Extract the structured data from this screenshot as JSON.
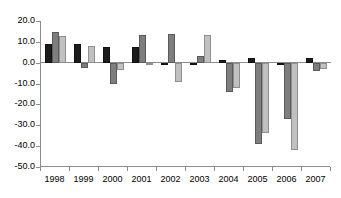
{
  "chart_data": {
    "type": "bar",
    "title": "",
    "subtitle": "",
    "xlabel": "",
    "ylabel": "",
    "categories": [
      "1998",
      "1999",
      "2000",
      "2001",
      "2002",
      "2003",
      "2004",
      "2005",
      "2006",
      "2007"
    ],
    "ylim": [
      -50.0,
      20.0
    ],
    "ytick_labels": [
      "20.0",
      "10.0",
      "0.0",
      "-10.0",
      "-20.0",
      "-30.0",
      "-40.0",
      "-50.0"
    ],
    "ytick_values": [
      20.0,
      10.0,
      0.0,
      -10.0,
      -20.0,
      -30.0,
      -40.0,
      -50.0
    ],
    "grid": false,
    "legend": "none",
    "series": [
      {
        "name": "series-1",
        "color": "#1c1c1c",
        "values": [
          9.0,
          9.0,
          7.5,
          7.5,
          -0.8,
          -1.0,
          1.5,
          2.2,
          -0.8,
          2.2
        ]
      },
      {
        "name": "series-2",
        "color": "#7e7e7e",
        "values": [
          14.8,
          -2.5,
          -10.3,
          13.5,
          13.8,
          3.2,
          -14.2,
          -39.0,
          -27.0,
          -4.0
        ]
      },
      {
        "name": "series-3",
        "color": "#c0c0c0",
        "values": [
          13.0,
          8.0,
          -3.5,
          -0.5,
          -9.2,
          13.2,
          -12.2,
          -33.8,
          -42.0,
          -2.8
        ]
      }
    ]
  }
}
